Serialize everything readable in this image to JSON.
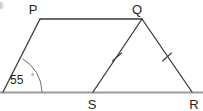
{
  "figure": {
    "type": "geometry-diagram",
    "width": 203,
    "height": 111,
    "background_color": "#ffffff",
    "line_color": "#3b3b3d",
    "base_line_color": "#9a9a9a",
    "arc_color": "#6e6e70",
    "label_color": "#231f20"
  },
  "vertices": [
    {
      "name": "P",
      "label": "P",
      "x": 40,
      "y": 19,
      "label_x": 33,
      "label_y": 13
    },
    {
      "name": "Q",
      "label": "Q",
      "x": 142,
      "y": 19,
      "label_x": 136,
      "label_y": 13
    },
    {
      "name": "S",
      "label": "S",
      "x": 93,
      "y": 92,
      "label_x": 89,
      "label_y": 108
    },
    {
      "name": "R",
      "label": "R",
      "x": 192,
      "y": 92,
      "label_x": 191,
      "label_y": 108
    },
    {
      "name": "left-vertex",
      "label": "",
      "x": 3,
      "y": 92,
      "label_x": 0,
      "label_y": 0
    }
  ],
  "edges": [
    {
      "name": "edge-PQ",
      "from": "P",
      "to": "Q",
      "style": "solid"
    },
    {
      "name": "edge-P-left",
      "from": "P",
      "to": "left-vertex",
      "style": "solid"
    },
    {
      "name": "edge-QS",
      "from": "Q",
      "to": "S",
      "style": "solid",
      "ticks": 1
    },
    {
      "name": "edge-QR",
      "from": "Q",
      "to": "R",
      "style": "solid",
      "ticks": 1
    },
    {
      "name": "edge-base",
      "from": "left-vertex",
      "to": "R",
      "style": "base"
    }
  ],
  "angles": [
    {
      "name": "angle-at-left-vertex",
      "value": "55",
      "degree_symbol": "°",
      "full_label": "55°",
      "label_x": 13,
      "label_y": 80,
      "arc_radius": 39
    }
  ],
  "tick_marks": [
    {
      "name": "tick-QS",
      "edge": "QS",
      "count": 1,
      "x": 117,
      "y": 57
    },
    {
      "name": "tick-QR",
      "edge": "QR",
      "count": 1,
      "x": 167,
      "y": 57
    }
  ],
  "partial_mark": {
    "name": "cropped-edge-mark",
    "visible": true,
    "x": 1,
    "y": 2
  }
}
